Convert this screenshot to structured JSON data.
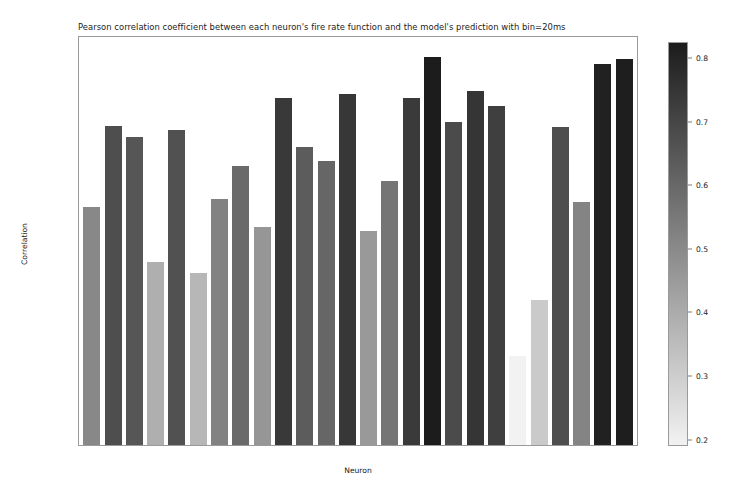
{
  "chart_data": {
    "type": "bar",
    "title": "Pearson correlation coefficient between each neuron's fire rate function and the model's prediction with bin=20ms",
    "xlabel": "Neuron",
    "ylabel": "Correlation",
    "categories": [
      0,
      1,
      2,
      3,
      4,
      5,
      6,
      7,
      8,
      9,
      10,
      11,
      12,
      13,
      14,
      15,
      16,
      17,
      18,
      19,
      20,
      21,
      22,
      23,
      24,
      25
    ],
    "values": [
      0.505,
      0.677,
      0.654,
      0.388,
      0.669,
      0.366,
      0.522,
      0.593,
      0.463,
      0.738,
      0.634,
      0.604,
      0.745,
      0.455,
      0.561,
      0.737,
      0.825,
      0.687,
      0.751,
      0.721,
      0.19,
      0.309,
      0.676,
      0.517,
      0.81,
      0.82
    ],
    "xlim": [
      -0.6,
      25.6
    ],
    "ylim": [
      0.0,
      0.8667
    ],
    "xticks": [
      "0",
      "5",
      "10",
      "15",
      "20",
      "25"
    ],
    "xtick_values": [
      0,
      5,
      10,
      15,
      20,
      25
    ],
    "yticks": [
      "0.0",
      "0.1",
      "0.2",
      "0.3",
      "0.4",
      "0.5",
      "0.6",
      "0.7",
      "0.8"
    ],
    "ytick_values": [
      0.0,
      0.1,
      0.2,
      0.3,
      0.4,
      0.5,
      0.6,
      0.7,
      0.8
    ],
    "grid": false,
    "legend": null,
    "colormap": {
      "name": "gray-reversed",
      "low_color": "#f2f2f2",
      "high_color": "#1c1c1c",
      "vmin": 0.19,
      "vmax": 0.825
    },
    "colorbar": {
      "position": "right",
      "orientation": "vertical",
      "ticks": [
        "0.2",
        "0.3",
        "0.4",
        "0.5",
        "0.6",
        "0.7",
        "0.8"
      ],
      "tick_values": [
        0.2,
        0.3,
        0.4,
        0.5,
        0.6,
        0.7,
        0.8
      ],
      "vmin": 0.19,
      "vmax": 0.825
    }
  }
}
